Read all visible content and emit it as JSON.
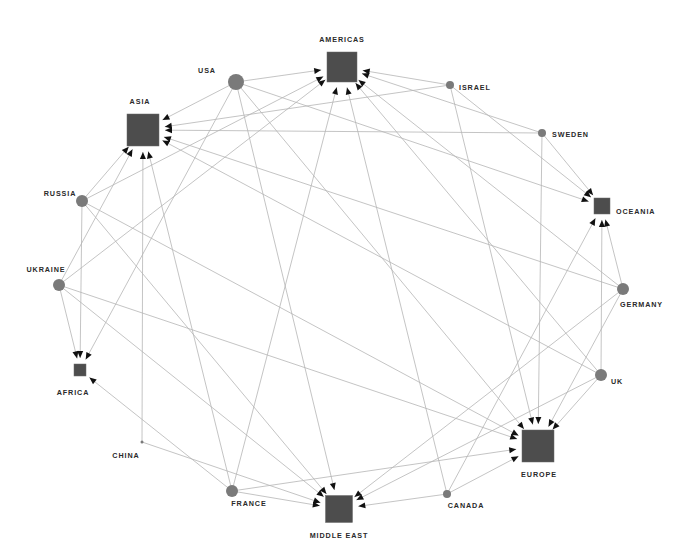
{
  "diagram": {
    "type": "directed-network",
    "colors": {
      "background": "#ffffff",
      "edge": "#b5b5b5",
      "arrowhead": "#111111",
      "source_node": "#7a7a7a",
      "target_node": "#4d4d4d",
      "label": "#2a2a2a"
    },
    "nodes": [
      {
        "id": "americas",
        "label": "AMERICAS",
        "shape": "square",
        "x": 342,
        "y": 67,
        "size": 30,
        "lx": 342,
        "ly": 42,
        "anchor": "middle"
      },
      {
        "id": "asia",
        "label": "ASIA",
        "shape": "square",
        "x": 143,
        "y": 130,
        "size": 32,
        "lx": 140,
        "ly": 104,
        "anchor": "middle"
      },
      {
        "id": "oceania",
        "label": "OCEANIA",
        "shape": "square",
        "x": 602,
        "y": 206,
        "size": 16,
        "lx": 616,
        "ly": 214,
        "anchor": "start"
      },
      {
        "id": "africa",
        "label": "AFRICA",
        "shape": "square",
        "x": 80,
        "y": 370,
        "size": 12,
        "lx": 73,
        "ly": 395,
        "anchor": "middle"
      },
      {
        "id": "europe",
        "label": "EUROPE",
        "shape": "square",
        "x": 538,
        "y": 446,
        "size": 32,
        "lx": 539,
        "ly": 477,
        "anchor": "middle"
      },
      {
        "id": "middle-east",
        "label": "MIDDLE EAST",
        "shape": "square",
        "x": 339,
        "y": 509,
        "size": 27,
        "lx": 339,
        "ly": 538,
        "anchor": "middle"
      },
      {
        "id": "usa",
        "label": "USA",
        "shape": "circle",
        "x": 236,
        "y": 82,
        "r": 8,
        "lx": 207,
        "ly": 73,
        "anchor": "middle"
      },
      {
        "id": "israel",
        "label": "ISRAEL",
        "shape": "circle",
        "x": 450,
        "y": 85,
        "r": 4,
        "lx": 459,
        "ly": 90,
        "anchor": "start"
      },
      {
        "id": "sweden",
        "label": "SWEDEN",
        "shape": "circle",
        "x": 542,
        "y": 133,
        "r": 4,
        "lx": 552,
        "ly": 137,
        "anchor": "start"
      },
      {
        "id": "russia",
        "label": "RUSSIA",
        "shape": "circle",
        "x": 82,
        "y": 201,
        "r": 6,
        "lx": 60,
        "ly": 196,
        "anchor": "middle"
      },
      {
        "id": "ukraine",
        "label": "UKRAINE",
        "shape": "circle",
        "x": 59,
        "y": 285,
        "r": 6,
        "lx": 46,
        "ly": 272,
        "anchor": "middle"
      },
      {
        "id": "germany",
        "label": "GERMANY",
        "shape": "circle",
        "x": 623,
        "y": 289,
        "r": 6,
        "lx": 620,
        "ly": 307,
        "anchor": "start"
      },
      {
        "id": "uk",
        "label": "UK",
        "shape": "circle",
        "x": 601,
        "y": 375,
        "r": 6,
        "lx": 611,
        "ly": 384,
        "anchor": "start"
      },
      {
        "id": "china",
        "label": "CHINA",
        "shape": "circle",
        "x": 142,
        "y": 442,
        "r": 1.5,
        "lx": 126,
        "ly": 458,
        "anchor": "middle"
      },
      {
        "id": "france",
        "label": "FRANCE",
        "shape": "circle",
        "x": 232,
        "y": 491,
        "r": 6,
        "lx": 249,
        "ly": 506,
        "anchor": "middle"
      },
      {
        "id": "canada",
        "label": "CANADA",
        "shape": "circle",
        "x": 447,
        "y": 494,
        "r": 4,
        "lx": 466,
        "ly": 508,
        "anchor": "middle"
      }
    ],
    "edges": [
      {
        "from": "usa",
        "to": "americas"
      },
      {
        "from": "usa",
        "to": "asia"
      },
      {
        "from": "usa",
        "to": "africa"
      },
      {
        "from": "usa",
        "to": "middle-east"
      },
      {
        "from": "usa",
        "to": "europe"
      },
      {
        "from": "usa",
        "to": "oceania"
      },
      {
        "from": "israel",
        "to": "americas"
      },
      {
        "from": "israel",
        "to": "asia"
      },
      {
        "from": "israel",
        "to": "oceania"
      },
      {
        "from": "israel",
        "to": "europe"
      },
      {
        "from": "sweden",
        "to": "americas"
      },
      {
        "from": "sweden",
        "to": "asia"
      },
      {
        "from": "sweden",
        "to": "oceania"
      },
      {
        "from": "sweden",
        "to": "europe"
      },
      {
        "from": "russia",
        "to": "americas"
      },
      {
        "from": "russia",
        "to": "asia"
      },
      {
        "from": "russia",
        "to": "africa"
      },
      {
        "from": "russia",
        "to": "middle-east"
      },
      {
        "from": "russia",
        "to": "europe"
      },
      {
        "from": "ukraine",
        "to": "asia"
      },
      {
        "from": "ukraine",
        "to": "africa"
      },
      {
        "from": "ukraine",
        "to": "middle-east"
      },
      {
        "from": "ukraine",
        "to": "europe"
      },
      {
        "from": "ukraine",
        "to": "americas"
      },
      {
        "from": "germany",
        "to": "asia"
      },
      {
        "from": "germany",
        "to": "americas"
      },
      {
        "from": "germany",
        "to": "oceania"
      },
      {
        "from": "germany",
        "to": "europe"
      },
      {
        "from": "germany",
        "to": "middle-east"
      },
      {
        "from": "uk",
        "to": "americas"
      },
      {
        "from": "uk",
        "to": "asia"
      },
      {
        "from": "uk",
        "to": "oceania"
      },
      {
        "from": "uk",
        "to": "europe"
      },
      {
        "from": "uk",
        "to": "middle-east"
      },
      {
        "from": "china",
        "to": "asia"
      },
      {
        "from": "china",
        "to": "middle-east"
      },
      {
        "from": "france",
        "to": "americas"
      },
      {
        "from": "france",
        "to": "asia"
      },
      {
        "from": "france",
        "to": "africa"
      },
      {
        "from": "france",
        "to": "europe"
      },
      {
        "from": "france",
        "to": "middle-east"
      },
      {
        "from": "canada",
        "to": "americas"
      },
      {
        "from": "canada",
        "to": "oceania"
      },
      {
        "from": "canada",
        "to": "europe"
      },
      {
        "from": "canada",
        "to": "middle-east"
      }
    ]
  }
}
